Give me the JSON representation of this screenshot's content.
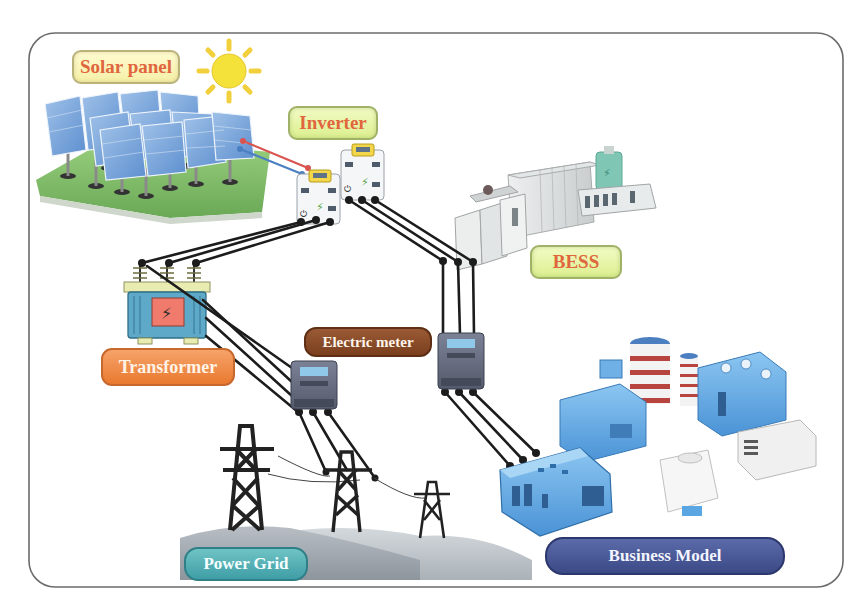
{
  "diagram": {
    "frame": {
      "border_color": "#6b6b6b",
      "background": "#ffffff"
    },
    "nodes": [
      {
        "id": "solar_panel",
        "label": "Solar panel",
        "icon": "solar-panel-array-icon"
      },
      {
        "id": "sun",
        "label": "",
        "icon": "sun-icon"
      },
      {
        "id": "inverter",
        "label": "Inverter",
        "icon": "inverter-icon",
        "count": 2
      },
      {
        "id": "bess",
        "label": "BESS",
        "icon": "battery-energy-storage-icon"
      },
      {
        "id": "transformer",
        "label": "Transformer",
        "icon": "transformer-icon"
      },
      {
        "id": "electric_meter",
        "label": "Electric meter",
        "icon": "electric-meter-icon",
        "count": 2
      },
      {
        "id": "power_grid",
        "label": "Power Grid",
        "icon": "transmission-tower-icon"
      },
      {
        "id": "business_model",
        "label": "Business Model",
        "icon": "factory-buildings-icon"
      }
    ],
    "edges": [
      {
        "from": "solar_panel",
        "to": "inverter",
        "style": "red-blue DC pair"
      },
      {
        "from": "inverter",
        "to": "transformer",
        "style": "3-phase line"
      },
      {
        "from": "inverter",
        "to": "bess",
        "style": "3-phase line"
      },
      {
        "from": "transformer",
        "to": "electric_meter",
        "style": "3-phase line"
      },
      {
        "from": "electric_meter",
        "to": "power_grid",
        "style": "3-phase line"
      },
      {
        "from": "bess",
        "to": "electric_meter",
        "style": "3-phase line"
      },
      {
        "from": "electric_meter",
        "to": "business_model",
        "style": "3-phase line"
      }
    ],
    "colors": {
      "label_yellow_text": "#e0663e",
      "transformer_label": "#e9792f",
      "meter_label": "#7a3f1e",
      "grid_label": "#3f9ea6",
      "business_label": "#3b4987",
      "wire": "#1c1c1c",
      "dc_positive": "#d9534f",
      "dc_negative": "#4a7fc1"
    }
  },
  "labels": {
    "solar_panel": "Solar panel",
    "inverter": "Inverter",
    "bess": "BESS",
    "transformer": "Transformer",
    "electric_meter": "Electric meter",
    "power_grid": "Power Grid",
    "business_model": "Business Model"
  }
}
